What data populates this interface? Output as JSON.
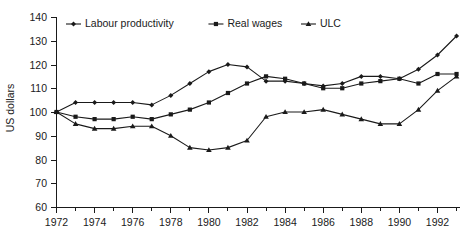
{
  "chart_data": {
    "type": "line",
    "title": "",
    "xlabel": "",
    "ylabel": "US dollars",
    "xlim": [
      1972,
      1993
    ],
    "ylim": [
      60,
      140
    ],
    "yticks": [
      60,
      70,
      80,
      90,
      100,
      110,
      120,
      130,
      140
    ],
    "xticks": [
      1972,
      1974,
      1976,
      1978,
      1980,
      1982,
      1984,
      1986,
      1988,
      1990,
      1992
    ],
    "xtick_labels": [
      "1972",
      "1974",
      "1976",
      "1978",
      "1980",
      "1982",
      "1984",
      "1986",
      "1988",
      "1990",
      "1992"
    ],
    "ytick_labels": [
      "60",
      "70",
      "80",
      "90",
      "100",
      "110",
      "120",
      "130",
      "140"
    ],
    "x": [
      1972,
      1973,
      1974,
      1975,
      1976,
      1977,
      1978,
      1979,
      1980,
      1981,
      1982,
      1983,
      1984,
      1985,
      1986,
      1987,
      1988,
      1989,
      1990,
      1991,
      1992,
      1993
    ],
    "grid": false,
    "legend_position": "top-left",
    "series": [
      {
        "name": "Labour productivity",
        "marker": "diamond",
        "values": [
          100,
          104,
          104,
          104,
          104,
          103,
          107,
          112,
          117,
          120,
          119,
          113,
          113,
          112,
          111,
          112,
          115,
          115,
          114,
          118,
          124,
          132
        ]
      },
      {
        "name": "Real wages",
        "marker": "square",
        "values": [
          100,
          98,
          97,
          97,
          98,
          97,
          99,
          101,
          104,
          108,
          112,
          115,
          114,
          112,
          110,
          110,
          112,
          113,
          114,
          112,
          116,
          116
        ]
      },
      {
        "name": "ULC",
        "marker": "triangle",
        "values": [
          100,
          95,
          93,
          93,
          94,
          94,
          90,
          85,
          84,
          85,
          88,
          98,
          100,
          100,
          101,
          99,
          97,
          95,
          95,
          101,
          109,
          115
        ]
      }
    ]
  },
  "legend": {
    "items": [
      {
        "label": "Labour productivity"
      },
      {
        "label": "Real wages"
      },
      {
        "label": "ULC"
      }
    ]
  },
  "axes": {
    "y_title": "US dollars"
  }
}
